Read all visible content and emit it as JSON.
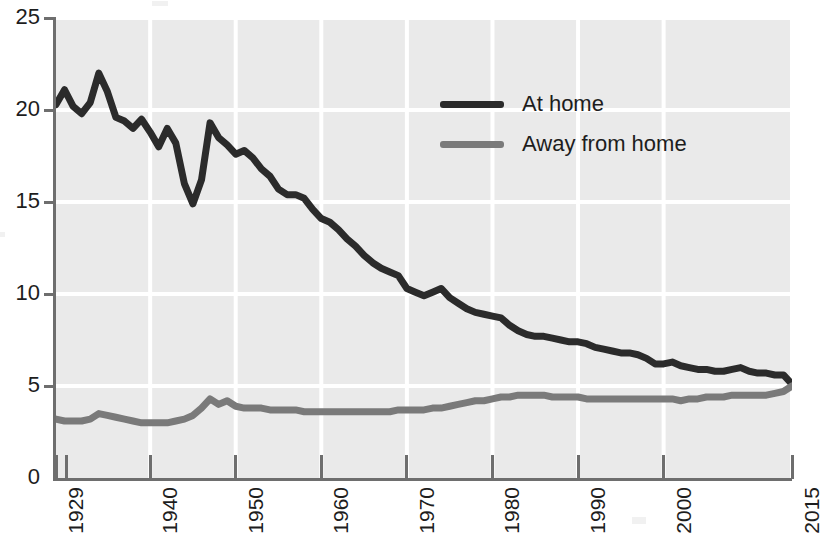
{
  "chart_data": {
    "type": "line",
    "title": "",
    "subtitle": "",
    "xlabel": "",
    "ylabel": "",
    "xlim": [
      1929,
      2015
    ],
    "ylim": [
      0,
      25
    ],
    "grid": true,
    "legend_position": "inside-upper-right",
    "x_tick_labels": [
      "1929",
      "1940",
      "1950",
      "1960",
      "1970",
      "1980",
      "1990",
      "2000",
      "2015"
    ],
    "x_tick_values": [
      1929,
      1940,
      1950,
      1960,
      1970,
      1980,
      1990,
      2000,
      2015
    ],
    "y_tick_labels": [
      "0",
      "5",
      "10",
      "15",
      "20",
      "25"
    ],
    "y_tick_values": [
      0,
      5,
      10,
      15,
      20,
      25
    ],
    "colors": {
      "at_home": "#2b2b2b",
      "away_from_home": "#7a7a7a",
      "plot_background": "#eaeaea",
      "gridline": "#ffffff",
      "axis": "#6e6e6e",
      "text": "#1d1d1d"
    },
    "x": [
      1929,
      1930,
      1931,
      1932,
      1933,
      1934,
      1935,
      1936,
      1937,
      1938,
      1939,
      1940,
      1941,
      1942,
      1943,
      1944,
      1945,
      1946,
      1947,
      1948,
      1949,
      1950,
      1951,
      1952,
      1953,
      1954,
      1955,
      1956,
      1957,
      1958,
      1959,
      1960,
      1961,
      1962,
      1963,
      1964,
      1965,
      1966,
      1967,
      1968,
      1969,
      1970,
      1971,
      1972,
      1973,
      1974,
      1975,
      1976,
      1977,
      1978,
      1979,
      1980,
      1981,
      1982,
      1983,
      1984,
      1985,
      1986,
      1987,
      1988,
      1989,
      1990,
      1991,
      1992,
      1993,
      1994,
      1995,
      1996,
      1997,
      1998,
      1999,
      2000,
      2001,
      2002,
      2003,
      2004,
      2005,
      2006,
      2007,
      2008,
      2009,
      2010,
      2011,
      2012,
      2013,
      2014,
      2015
    ],
    "series": [
      {
        "name": "At home",
        "color": "#2b2b2b",
        "values": [
          20.3,
          21.1,
          20.2,
          19.8,
          20.4,
          22.0,
          21.0,
          19.6,
          19.4,
          19.0,
          19.5,
          18.8,
          18.0,
          19.0,
          18.2,
          16.0,
          14.9,
          16.2,
          19.3,
          18.5,
          18.1,
          17.6,
          17.8,
          17.4,
          16.8,
          16.4,
          15.7,
          15.4,
          15.4,
          15.2,
          14.6,
          14.1,
          13.9,
          13.5,
          13.0,
          12.6,
          12.1,
          11.7,
          11.4,
          11.2,
          11.0,
          10.3,
          10.1,
          9.9,
          10.1,
          10.3,
          9.8,
          9.5,
          9.2,
          9.0,
          8.9,
          8.8,
          8.7,
          8.3,
          8.0,
          7.8,
          7.7,
          7.7,
          7.6,
          7.5,
          7.4,
          7.4,
          7.3,
          7.1,
          7.0,
          6.9,
          6.8,
          6.8,
          6.7,
          6.5,
          6.2,
          6.2,
          6.3,
          6.1,
          6.0,
          5.9,
          5.9,
          5.8,
          5.8,
          5.9,
          6.0,
          5.8,
          5.7,
          5.7,
          5.6,
          5.6,
          5.1
        ]
      },
      {
        "name": "Away from home",
        "color": "#7a7a7a",
        "values": [
          3.2,
          3.1,
          3.1,
          3.1,
          3.2,
          3.5,
          3.4,
          3.3,
          3.2,
          3.1,
          3.0,
          3.0,
          3.0,
          3.0,
          3.1,
          3.2,
          3.4,
          3.8,
          4.3,
          4.0,
          4.2,
          3.9,
          3.8,
          3.8,
          3.8,
          3.7,
          3.7,
          3.7,
          3.7,
          3.6,
          3.6,
          3.6,
          3.6,
          3.6,
          3.6,
          3.6,
          3.6,
          3.6,
          3.6,
          3.6,
          3.7,
          3.7,
          3.7,
          3.7,
          3.8,
          3.8,
          3.9,
          4.0,
          4.1,
          4.2,
          4.2,
          4.3,
          4.4,
          4.4,
          4.5,
          4.5,
          4.5,
          4.5,
          4.4,
          4.4,
          4.4,
          4.4,
          4.3,
          4.3,
          4.3,
          4.3,
          4.3,
          4.3,
          4.3,
          4.3,
          4.3,
          4.3,
          4.3,
          4.2,
          4.3,
          4.3,
          4.4,
          4.4,
          4.4,
          4.5,
          4.5,
          4.5,
          4.5,
          4.5,
          4.6,
          4.7,
          5.0
        ]
      }
    ]
  },
  "legend": {
    "items": [
      {
        "label": "At home",
        "color": "#2b2b2b"
      },
      {
        "label": "Away from home",
        "color": "#7a7a7a"
      }
    ]
  }
}
